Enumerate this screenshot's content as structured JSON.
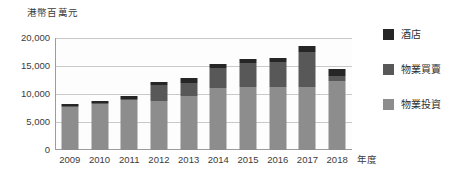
{
  "chart_data": {
    "type": "bar",
    "stacked": true,
    "title": "",
    "subtitle": "",
    "ylabel": "港幣百萬元",
    "xlabel": "年度",
    "categories": [
      "2009",
      "2010",
      "2011",
      "2012",
      "2013",
      "2014",
      "2015",
      "2016",
      "2017",
      "2018"
    ],
    "series": [
      {
        "name": "物業投資",
        "color": "#8d8d8d",
        "values": [
          7700,
          8200,
          8900,
          8800,
          9600,
          11100,
          11200,
          11200,
          11300,
          12300
        ]
      },
      {
        "name": "物業買賣",
        "color": "#585858",
        "values": [
          200,
          200,
          300,
          2800,
          2400,
          3600,
          4400,
          4500,
          6200,
          900
        ]
      },
      {
        "name": "酒店",
        "color": "#262626",
        "values": [
          300,
          400,
          500,
          500,
          900,
          600,
          700,
          700,
          1000,
          1200
        ]
      }
    ],
    "totals": [
      8200,
      8800,
      9700,
      12100,
      12900,
      15300,
      16300,
      16400,
      18500,
      14400
    ],
    "ylim": [
      0,
      20000
    ],
    "yticks": [
      0,
      5000,
      10000,
      15000,
      20000
    ],
    "ytick_labels": [
      "0",
      "5,000",
      "10,000",
      "15,000",
      "20,000"
    ],
    "grid": true,
    "legend_position": "right",
    "legend": [
      {
        "label": "酒店",
        "color": "#262626"
      },
      {
        "label": "物業買賣",
        "color": "#585858"
      },
      {
        "label": "物業投資",
        "color": "#8d8d8d"
      }
    ]
  }
}
